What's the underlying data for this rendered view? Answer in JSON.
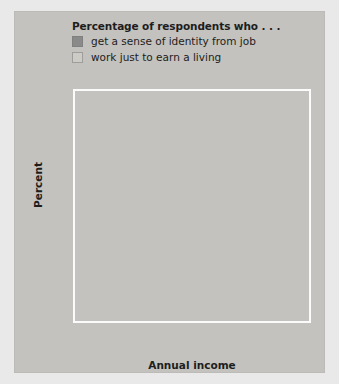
{
  "chart_data": {
    "type": "bar",
    "title": "Percentage of respondents who . . .",
    "xlabel": "Annual income",
    "ylabel": "Percent",
    "categories": [
      "Less than $30,000",
      "$30,000–$50,000",
      "$50,000–$75,000",
      "$75,000+"
    ],
    "category_lines": [
      [
        "Less than",
        "$30,000"
      ],
      [
        "$30,000–",
        "$50,000"
      ],
      [
        "$50,000–",
        "$75,000"
      ],
      [
        "$75,000+",
        ""
      ]
    ],
    "series": [
      {
        "name": "get a sense of identity from job",
        "color": "#8a8a8a",
        "values": [
          44,
          52,
          57.5,
          68.5
        ]
      },
      {
        "name": "work just to earn a living",
        "color": "#cbc9c4",
        "values": [
          53,
          45.5,
          40.5,
          32
        ]
      }
    ],
    "ylim": [
      0,
      70
    ],
    "ytick_step": 10,
    "yticks": [
      70,
      60,
      50,
      40,
      30,
      20,
      10,
      0
    ],
    "grid": true,
    "grid_color": "#fbfbfb",
    "legend_position": "top-left",
    "panel_color": "#c3c2be",
    "figure_color": "#e9e9e9"
  }
}
